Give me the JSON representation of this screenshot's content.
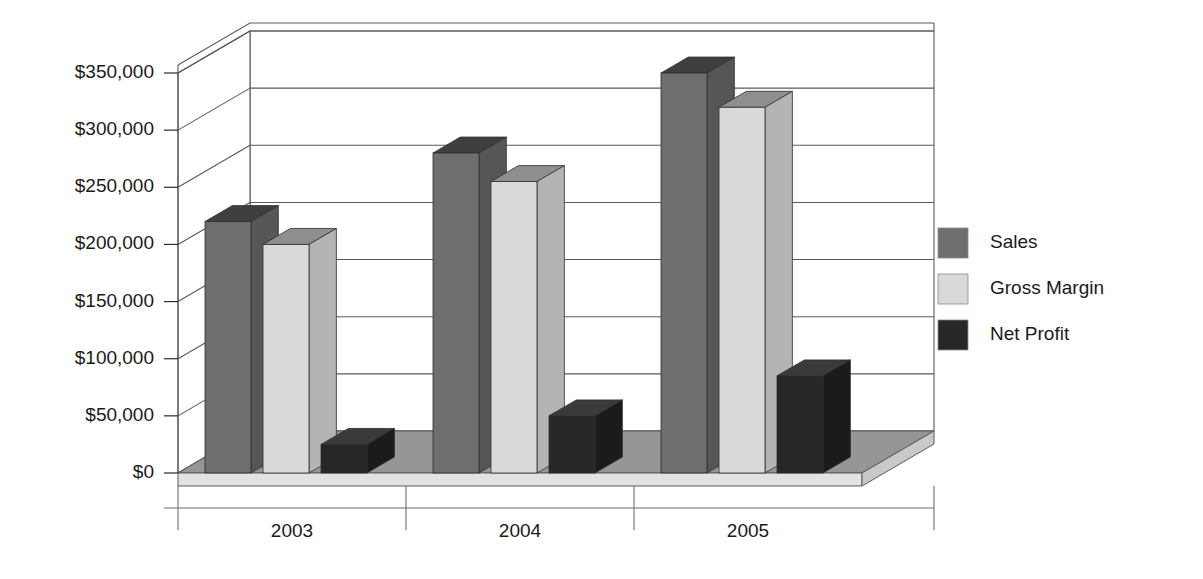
{
  "chart_data": {
    "type": "bar",
    "title": "",
    "subtitle": "",
    "xlabel": "",
    "ylabel": "",
    "categories": [
      "2003",
      "2004",
      "2005"
    ],
    "series": [
      {
        "name": "Sales",
        "values": [
          220000,
          280000,
          350000
        ],
        "color": "#6e6e6e"
      },
      {
        "name": "Gross Margin",
        "values": [
          200000,
          255000,
          320000
        ],
        "color": "#d9d9d9"
      },
      {
        "name": "Net Profit",
        "values": [
          25000,
          50000,
          85000
        ],
        "color": "#272727"
      }
    ],
    "ylim": [
      0,
      350000
    ],
    "ytick_values": [
      0,
      50000,
      100000,
      150000,
      200000,
      250000,
      300000,
      350000
    ],
    "ytick_labels": [
      "$0",
      "$50,000",
      "$100,000",
      "$150,000",
      "$200,000",
      "$250,000",
      "$300,000",
      "$350,000"
    ],
    "grid": true,
    "legend_position": "right",
    "three_d": true
  },
  "legend": {
    "items": [
      {
        "label": "Sales",
        "swatch_color": "#6e6e6e"
      },
      {
        "label": "Gross Margin",
        "swatch_color": "#d9d9d9"
      },
      {
        "label": "Net Profit",
        "swatch_color": "#272727"
      }
    ]
  },
  "axes": {
    "y_labels": [
      "$350,000",
      "$300,000",
      "$250,000",
      "$200,000",
      "$150,000",
      "$100,000",
      "$50,000",
      "$0"
    ],
    "x_labels": [
      "2003",
      "2004",
      "2005"
    ]
  },
  "colors": {
    "background": "#ffffff",
    "floor_top": "#969696",
    "floor_front": "#e2e2e2",
    "wall": "#ffffff",
    "gridline": "#5a5a5a",
    "text": "#1a1a1a",
    "sales_front": "#6e6e6e",
    "sales_side": "#565656",
    "sales_top": "#3f3f3f",
    "margin_front": "#d9d9d9",
    "margin_side": "#b4b4b4",
    "margin_top": "#8f8f8f",
    "profit_front": "#272727",
    "profit_side": "#1b1b1b",
    "profit_top": "#3a3a3a"
  }
}
